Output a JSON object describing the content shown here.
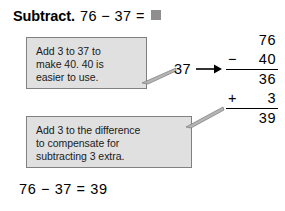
{
  "title": {
    "label": "Subtract.",
    "expression": "76 − 37 =",
    "placeholder_icon": "gray-square-answer-box",
    "placeholder_color": "#8e8e8e"
  },
  "callouts": [
    {
      "id": "regroup-hint",
      "lines": [
        "Add 3 to 37 to",
        "make 40. 40 is",
        "easier to use."
      ],
      "fill_color": "#e0e0e0",
      "border_color": "#808080"
    },
    {
      "id": "compensate-hint",
      "lines": [
        "Add 3 to the difference",
        "to compensate for",
        "subtracting 3 extra."
      ],
      "fill_color": "#e0e0e0",
      "border_color": "#808080"
    }
  ],
  "transform": {
    "value": "37",
    "arrow_icon": "right-arrow-icon"
  },
  "computation": {
    "rows": [
      {
        "operator": "",
        "number": "76",
        "ruled": false
      },
      {
        "operator": "−",
        "number": "40",
        "ruled": true
      },
      {
        "operator": "",
        "number": "36",
        "ruled": false
      },
      {
        "operator": "+",
        "number": "3",
        "ruled": true
      },
      {
        "operator": "",
        "number": "39",
        "ruled": false
      }
    ]
  },
  "final_equation": "76 − 37 = 39"
}
